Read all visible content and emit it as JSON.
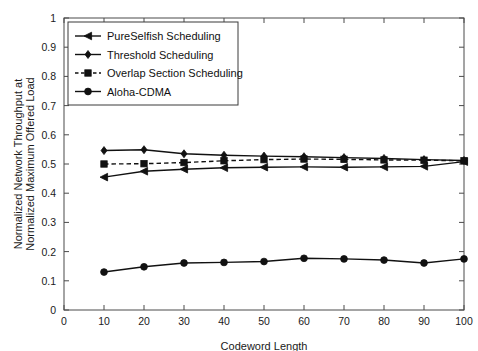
{
  "chart_data": {
    "type": "line",
    "title": "",
    "xlabel": "Codeword Length",
    "ylabel": "Normalized Network Throughput at Normalized Maximum Offered Load",
    "ylabel_line1": "Normalized Network Throughput at",
    "ylabel_line2": "Normalized Maximum Offered Load",
    "x": [
      10,
      20,
      30,
      40,
      50,
      60,
      70,
      80,
      90,
      100
    ],
    "xlim": [
      0,
      100
    ],
    "ylim": [
      0,
      1
    ],
    "xticks": [
      "0",
      "10",
      "20",
      "30",
      "40",
      "50",
      "60",
      "70",
      "80",
      "90",
      "100"
    ],
    "xtick_values": [
      0,
      10,
      20,
      30,
      40,
      50,
      60,
      70,
      80,
      90,
      100
    ],
    "yticks": [
      "0",
      "0.1",
      "0.2",
      "0.3",
      "0.4",
      "0.5",
      "0.6",
      "0.7",
      "0.8",
      "0.9",
      "1"
    ],
    "ytick_values": [
      0,
      0.1,
      0.2,
      0.3,
      0.4,
      0.5,
      0.6,
      0.7,
      0.8,
      0.9,
      1
    ],
    "grid": false,
    "legend_position": "upper left",
    "series": [
      {
        "name": "PureSelfish Scheduling",
        "marker": "triangle-left",
        "linestyle": "solid",
        "color": "#111111",
        "values": [
          0.455,
          0.475,
          0.482,
          0.487,
          0.489,
          0.49,
          0.489,
          0.49,
          0.492,
          0.508
        ]
      },
      {
        "name": "Threshold Scheduling",
        "marker": "diamond",
        "linestyle": "solid",
        "color": "#111111",
        "values": [
          0.546,
          0.549,
          0.535,
          0.53,
          0.527,
          0.525,
          0.522,
          0.519,
          0.515,
          0.512
        ]
      },
      {
        "name": "Overlap Section Scheduling",
        "marker": "square",
        "linestyle": "dashed",
        "color": "#111111",
        "values": [
          0.5,
          0.501,
          0.505,
          0.511,
          0.515,
          0.517,
          0.516,
          0.514,
          0.513,
          0.511
        ]
      },
      {
        "name": "Aloha-CDMA",
        "marker": "circle",
        "linestyle": "solid",
        "color": "#111111",
        "values": [
          0.13,
          0.148,
          0.161,
          0.163,
          0.166,
          0.177,
          0.175,
          0.171,
          0.161,
          0.175
        ]
      }
    ]
  }
}
